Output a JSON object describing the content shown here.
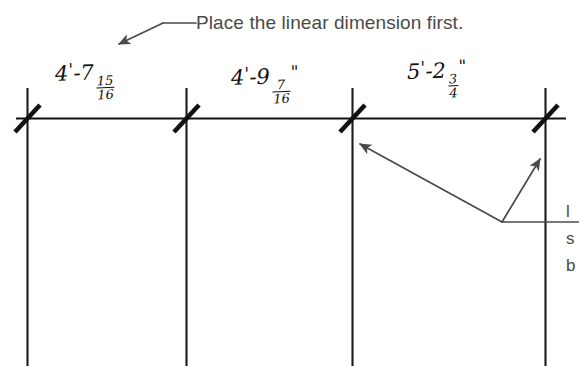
{
  "figure": {
    "type": "technical-drawing-instruction",
    "background_color": "#ffffff",
    "ink_color": "#111111",
    "print_text_color": "#4a4a4a",
    "width": 579,
    "height": 366
  },
  "callout": {
    "main_note": "Place the linear dimension first.",
    "leader_arrow_name": "leader-arrow-pointing-to-dimension-line",
    "side_note_line_1": "l",
    "side_note_line_2": "s",
    "side_note_line_3": "b",
    "side_note_full": "l\ns\nb"
  },
  "dimension_string": {
    "style": "architectural-tick-slash",
    "segments": [
      {
        "index": 1,
        "label_feet": "4",
        "label_inches_whole": "7",
        "fraction_numerator": "15",
        "fraction_denominator": "16",
        "foot_mark": "'",
        "inch_mark": "",
        "display": "4'-7 15/16",
        "start_x": 27,
        "end_x": 186
      },
      {
        "index": 2,
        "label_feet": "4",
        "label_inches_whole": "9",
        "fraction_numerator": "7",
        "fraction_denominator": "16",
        "foot_mark": "'",
        "inch_mark": "\"",
        "display": "4'-9 7/16\"",
        "start_x": 186,
        "end_x": 352
      },
      {
        "index": 3,
        "label_feet": "5",
        "label_inches_whole": "2",
        "fraction_numerator": "3",
        "fraction_denominator": "4",
        "foot_mark": "'",
        "inch_mark": "\"",
        "display": "5'-2 3/4\"",
        "start_x": 352,
        "end_x": 545
      }
    ],
    "dimension_line_y": 118,
    "extension_line_positions": [
      27,
      186,
      352,
      545
    ],
    "extension_line_top": 88,
    "extension_line_bottom": 366,
    "tick_count": 4
  },
  "annotation_arrows": [
    {
      "name": "arrow-to-third-extension-line",
      "from_x": 502,
      "from_y": 222,
      "to_x": 358,
      "to_y": 142
    },
    {
      "name": "arrow-to-fourth-extension-line",
      "from_x": 502,
      "from_y": 222,
      "to_x": 541,
      "to_y": 158
    },
    {
      "name": "leader-line-to-side-note",
      "from_x": 502,
      "from_y": 222,
      "to_x": 579,
      "to_y": 222
    }
  ]
}
